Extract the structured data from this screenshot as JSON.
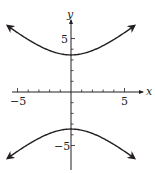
{
  "chart_data": {
    "type": "line",
    "title": "",
    "xlabel": "x",
    "ylabel": "y",
    "xlim": [
      -6.5,
      6.5
    ],
    "ylim": [
      -7,
      8
    ],
    "grid": false,
    "x_ticks": [
      -5,
      -4,
      -3,
      -2,
      -1,
      1,
      2,
      3,
      4,
      5
    ],
    "y_ticks": [
      -5,
      -4,
      -3,
      -2,
      -1,
      1,
      2,
      3,
      4,
      5
    ],
    "x_tick_labels": {
      "-5": "−5",
      "5": "5"
    },
    "y_tick_labels": {
      "5": "5",
      "-5": "−5"
    },
    "series": [
      {
        "name": "upper branch",
        "x": [
          -5.9,
          -4,
          -2,
          0,
          2,
          4,
          5.9
        ],
        "y": [
          6.2,
          5.0,
          3.9,
          3.46,
          3.9,
          5.0,
          6.2
        ]
      },
      {
        "name": "lower branch",
        "x": [
          -5.9,
          -4,
          -2,
          0,
          2,
          4,
          5.9
        ],
        "y": [
          -6.2,
          -5.0,
          -3.9,
          -3.46,
          -3.9,
          -5.0,
          -6.2
        ]
      }
    ],
    "colors": {
      "curve": "#231f20",
      "axis": "#231f20"
    }
  },
  "labels": {
    "x_axis": "x",
    "y_axis": "y",
    "x_neg5": "−5",
    "x_pos5": "5",
    "y_pos5": "5",
    "y_neg5": "−5"
  }
}
